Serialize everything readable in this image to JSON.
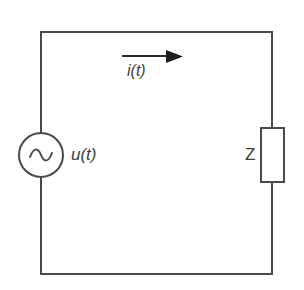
{
  "figure": {
    "background_color": "#ffffff",
    "line_color": "#4a4a4a",
    "text_color": "#3c3c3c",
    "line_width": 2
  },
  "labels": {
    "voltage_source": "u(t)",
    "current_arrow": "i(t)",
    "impedance": "Z"
  },
  "icons": {
    "ac_source": "sine-wave-symbol",
    "current_direction": "arrow-right-icon"
  },
  "geometry": {
    "loop": {
      "left": 41,
      "top": 32,
      "right": 272,
      "bottom": 274
    },
    "source_circle": {
      "cx": 41,
      "cy": 155,
      "r": 22
    },
    "impedance_box": {
      "x": 261,
      "y": 128,
      "width": 23,
      "height": 54
    },
    "current_arrow": {
      "x1": 122,
      "x2": 182,
      "y": 56
    }
  }
}
